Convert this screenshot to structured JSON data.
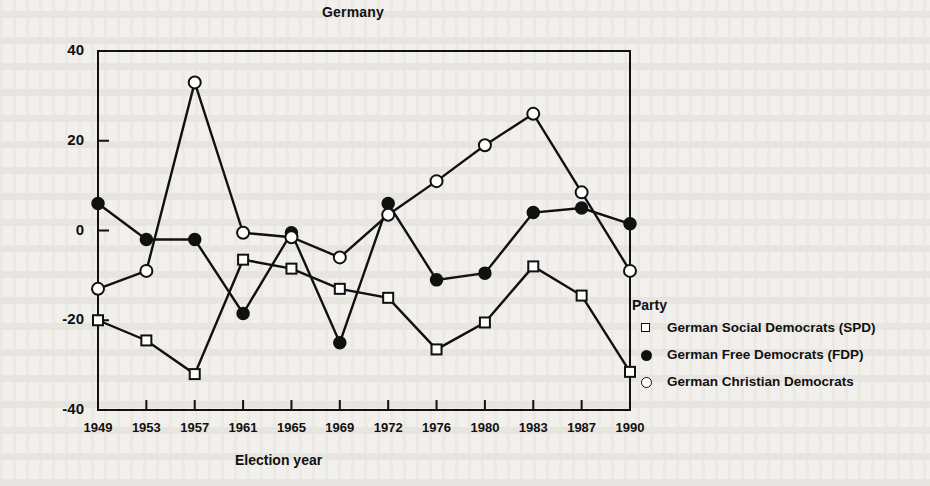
{
  "chart_data": {
    "type": "line",
    "title": "Germany",
    "xlabel": "Election year",
    "ylabel": "",
    "categories": [
      "1949",
      "1953",
      "1957",
      "1961",
      "1965",
      "1969",
      "1972",
      "1976",
      "1980",
      "1983",
      "1987",
      "1990"
    ],
    "ylim": [
      -40,
      40
    ],
    "yticks": [
      "40",
      "20",
      "0",
      "-20",
      "-40"
    ],
    "ytick_values": [
      40,
      20,
      0,
      -20,
      -40
    ],
    "grid": false,
    "legend_position": "right",
    "legend_title": "Party",
    "series": [
      {
        "name": "German Social Democrats (SPD)",
        "marker": "open-square",
        "values": [
          -20,
          -24.5,
          -32,
          -6.5,
          -8.5,
          -13,
          -15,
          -26.5,
          -20.5,
          -8,
          -14.5,
          -31.5
        ]
      },
      {
        "name": "German Free Democrats (FDP)",
        "marker": "filled-circle",
        "values": [
          6,
          -2,
          -2,
          -18.5,
          -0.5,
          -25,
          6,
          -11,
          -9.5,
          4,
          5,
          1.5
        ]
      },
      {
        "name": "German Christian Democrats",
        "marker": "open-circle",
        "values": [
          -13,
          -9,
          33,
          -0.5,
          -1.5,
          -6,
          3.5,
          11,
          19,
          26,
          8.5,
          -9
        ]
      }
    ]
  },
  "figure": {
    "title": "Germany",
    "xaxis_title": "Election year",
    "legend_title": "Party",
    "legend_items": [
      {
        "label": "German Social Democrats (SPD)",
        "marker": "open-square"
      },
      {
        "label": "German Free Democrats (FDP)",
        "marker": "filled-circle"
      },
      {
        "label": "German Christian Democrats",
        "marker": "open-circle"
      }
    ],
    "ytick_labels": [
      "40",
      "20",
      "0",
      "-20",
      "-40"
    ],
    "xtick_labels": [
      "1949",
      "1953",
      "1957",
      "1961",
      "1965",
      "1969",
      "1972",
      "1976",
      "1980",
      "1983",
      "1987",
      "1990"
    ],
    "colors": {
      "ink": "#111111",
      "paper": "#f2f0ec"
    }
  }
}
